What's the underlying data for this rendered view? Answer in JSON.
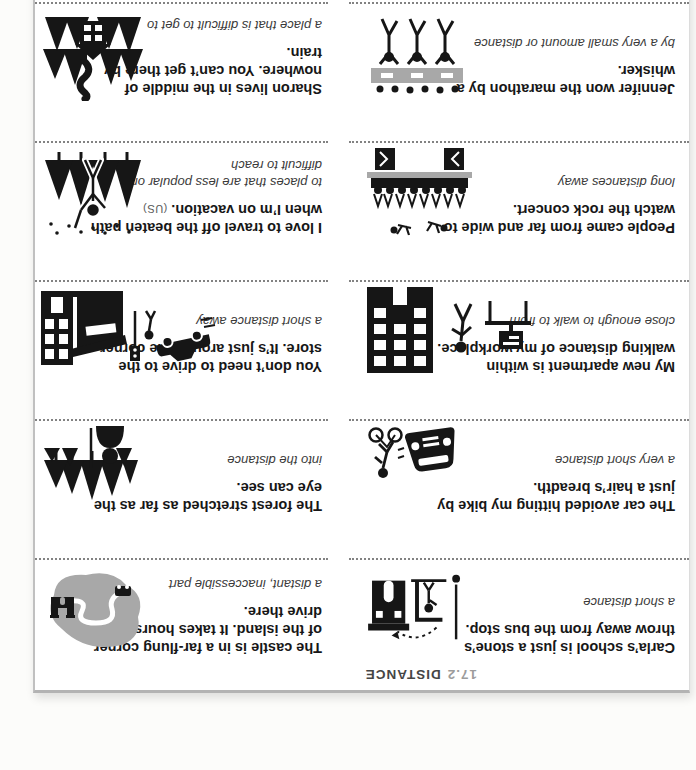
{
  "page": {
    "header": {
      "number": "17.2",
      "title": "DISTANCE"
    },
    "colors": {
      "icon_black": "#161616",
      "icon_gray": "#a8a8a8",
      "dotted_rule": "#828282",
      "header_number_gray": "#9c9c9c"
    },
    "columns": {
      "left": [
        {
          "phrase": "Carla’s school is just a stone’s throw away from the bus stop.",
          "definition": "a short distance",
          "icon": "school-bus-stop-icon"
        },
        {
          "phrase": "The car avoided hitting my bike by just a hair’s breadth.",
          "definition": "a very short distance",
          "icon": "car-bicycle-icon"
        },
        {
          "phrase": "My new apartment is within walking distance of my workplace.",
          "definition": "close enough to walk to from",
          "icon": "apartment-walk-workplace-icon"
        },
        {
          "phrase": "People came from far and wide to watch the rock concert.",
          "definition": "long distances away",
          "icon": "concert-crowd-icon"
        },
        {
          "phrase": "Jennifer won the marathon by a whisker.",
          "definition": "by a very small amount or distance",
          "icon": "marathon-finish-icon"
        }
      ],
      "right": [
        {
          "phrase": "The castle is in a far-flung corner of the island. It takes hours to drive there.",
          "definition": "a distant, inaccessible part",
          "icon": "island-map-icon"
        },
        {
          "phrase": "The forest stretched as far as the eye can see.",
          "definition": "into the distance",
          "icon": "forest-viewer-icon"
        },
        {
          "phrase": "You don’t need to drive to the store. It’s just around the corner.",
          "definition": "a short distance away",
          "icon": "store-corner-icon"
        },
        {
          "phrase": "I love to travel off the beaten path when I’m on vacation.",
          "note": "(US)",
          "definition": "to places that are less popular or difficult to reach",
          "icon": "hiker-trees-icon"
        },
        {
          "phrase": "Sharon lives in the middle of nowhere. You can’t get there by train.",
          "definition": "a place that is difficult to get to",
          "icon": "house-forest-train-icon"
        }
      ]
    }
  }
}
